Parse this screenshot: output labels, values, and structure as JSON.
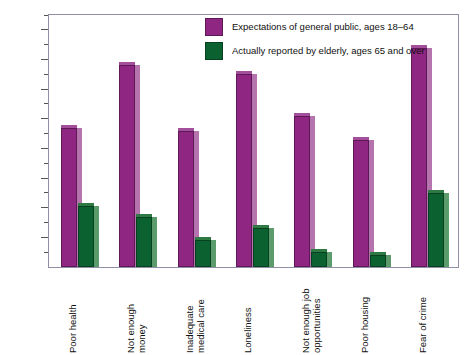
{
  "chart_data": {
    "type": "bar",
    "title": "",
    "xlabel": "",
    "ylabel": "Percent reporting",
    "ylim": [
      0,
      85
    ],
    "ytick_values": [
      10,
      20,
      30,
      40,
      50,
      60,
      70,
      80
    ],
    "ytick_labels": [
      "10",
      "20",
      "30",
      "40",
      "50",
      "60",
      "70",
      "80"
    ],
    "grid": false,
    "legend_position": "top-right-inside",
    "categories": [
      "Poor health",
      "Not enough money",
      "Inadequate medical care",
      "Loneliness",
      "Not enough job opportunities",
      "Poor housing",
      "Fear of crime"
    ],
    "category_lines": [
      [
        "Poor health"
      ],
      [
        "Not enough",
        "money"
      ],
      [
        "Inadequate",
        "medical care"
      ],
      [
        "Loneliness"
      ],
      [
        "Not enough job",
        "opportunities"
      ],
      [
        "Poor housing"
      ],
      [
        "Fear of crime"
      ]
    ],
    "series": [
      {
        "name": "Expectations of general public, ages 18–64",
        "color": "#8e2682",
        "values": [
          47,
          68,
          46,
          65,
          51,
          43,
          74
        ]
      },
      {
        "name": "Actually reported by elderly, ages 65 and over",
        "color": "#0b6130",
        "values": [
          20.5,
          17,
          9,
          13,
          5,
          4,
          25
        ]
      }
    ]
  },
  "legend": {
    "items": [
      {
        "label": "Expectations of general public, ages 18–64",
        "color": "#8e2682"
      },
      {
        "label": "Actually reported by elderly, ages 65 and over",
        "color": "#0b6130"
      }
    ]
  },
  "axis": {
    "y_title": "Percent reporting"
  }
}
